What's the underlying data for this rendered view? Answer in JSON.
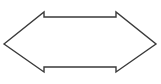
{
  "canvas": {
    "width": 161,
    "height": 84,
    "background_color": "#ffffff"
  },
  "shape": {
    "name": "double-headed-arrow",
    "label": "Left-right double arrow outline",
    "fill_color": "#ffffff",
    "stroke_color": "#3a3a3a",
    "stroke_width": 1.4,
    "orientation": "horizontal-bidirectional",
    "points": [
      [
        4,
        44
      ],
      [
        44,
        12
      ],
      [
        44,
        17
      ],
      [
        116,
        17
      ],
      [
        116,
        12
      ],
      [
        156,
        44
      ],
      [
        116,
        72
      ],
      [
        116,
        67
      ],
      [
        44,
        67
      ],
      [
        44,
        72
      ]
    ],
    "geometry": {
      "left_tip_x": 4,
      "right_tip_x": 156,
      "center_y": 44,
      "shaft_top_y": 17,
      "shaft_bottom_y": 67,
      "head_top_y": 12,
      "head_bottom_y": 72,
      "left_head_inner_x": 44,
      "right_head_inner_x": 116
    }
  }
}
